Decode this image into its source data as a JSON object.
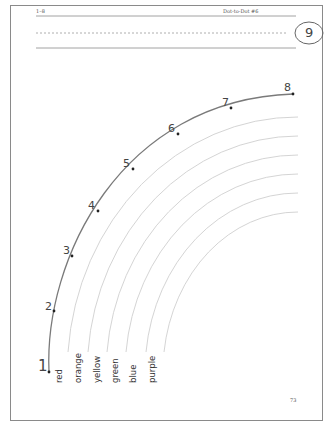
{
  "header": {
    "range_label": "1–8",
    "title": "Dot-to-Dot #6",
    "circle_number": "9"
  },
  "dots": [
    {
      "label": "1",
      "x": 49,
      "y": 372
    },
    {
      "label": "2",
      "x": 54,
      "y": 311
    },
    {
      "label": "3",
      "x": 72,
      "y": 256
    },
    {
      "label": "4",
      "x": 98,
      "y": 211
    },
    {
      "label": "5",
      "x": 133,
      "y": 169
    },
    {
      "label": "6",
      "x": 178,
      "y": 134
    },
    {
      "label": "7",
      "x": 231,
      "y": 108
    },
    {
      "label": "8",
      "x": 293,
      "y": 94
    }
  ],
  "color_labels": [
    "red",
    "orange",
    "yellow",
    "green",
    "blue",
    "purple"
  ],
  "footer": {
    "page_number": "73"
  },
  "colors": {
    "frame": "#8a8a8a",
    "outer_arc": "#7a7a7a",
    "inner_arc": "#cfcfcf",
    "dot": "#222222"
  }
}
